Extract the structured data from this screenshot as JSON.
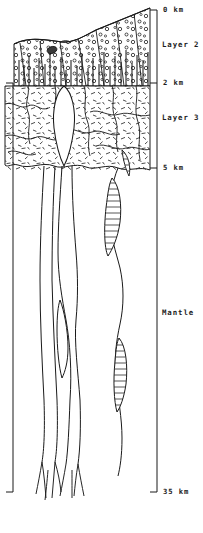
{
  "figure": {
    "type": "geological-cross-section",
    "orientation": "vertical depth profile"
  },
  "depth_axis": {
    "units": "km",
    "position": "right",
    "ticks": [
      {
        "label": "0 km",
        "value": 0,
        "y": 10
      },
      {
        "label": "2 km",
        "value": 2,
        "y": 83
      },
      {
        "label": "5 km",
        "value": 5,
        "y": 168
      },
      {
        "label": "35 km",
        "value": 35,
        "y": 492
      }
    ]
  },
  "layers": [
    {
      "name": "Layer 2",
      "label_y": 45,
      "top_km": 0,
      "bottom_km": 2,
      "texture": "pillow-lava-and-sheeted-dikes",
      "description": "Stippled circles over vertical dike lines"
    },
    {
      "name": "Layer 3",
      "label_y": 118,
      "top_km": 2,
      "bottom_km": 5,
      "texture": "gabbro-dashes",
      "description": "Short random dash ornament"
    },
    {
      "name": "Mantle",
      "label_y": 313,
      "top_km": 5,
      "bottom_km": 35,
      "texture": "blank",
      "description": "Unornamented region traversed by magma conduits"
    }
  ],
  "features": [
    {
      "name": "axial-summit-depression",
      "description": "Shallow trough at the top of Layer 2"
    },
    {
      "name": "pillow-lava-pod",
      "description": "Small dark ellipse near the axial summit"
    },
    {
      "name": "left-magma-conduit",
      "description": "Narrow melt channel descending from Layer 3 to 35 km"
    },
    {
      "name": "central-magma-chamber",
      "description": "Lens-shaped body in Layer 3 feeding the dike complex"
    },
    {
      "name": "right-magma-conduit",
      "description": "Hatched melt pocket chain descending through the mantle"
    },
    {
      "name": "conduit-roots",
      "description": "Branching root network at the base of the mantle section"
    }
  ],
  "style": {
    "line_color": "#1a1a1a",
    "background": "#ffffff",
    "ornament_color": "#2b2b2b"
  }
}
